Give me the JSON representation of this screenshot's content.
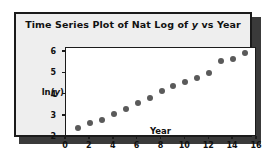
{
  "figure": {
    "title": "Time Series Plot of Nat Log of y vs Year",
    "title_parts": {
      "before_italic": "Time Series Plot of Nat Log of ",
      "italic": "y",
      "after_italic": " vs Year"
    },
    "background_color": "#eeeeee",
    "border_color": "#1b1b1b",
    "plot_background_color": "#ffffff",
    "marker_color": "#5a5a5a"
  },
  "axes": {
    "y_label_parts": {
      "before_italic": "ln(",
      "italic": "y",
      "after_italic": ")"
    },
    "y_label": "ln(y)",
    "x_label": "Year",
    "y_ticks": [
      "2",
      "3",
      "4",
      "5",
      "6"
    ],
    "x_ticks": [
      "0",
      "2",
      "4",
      "6",
      "8",
      "10",
      "12",
      "14",
      "16"
    ]
  },
  "chart_data": {
    "type": "scatter",
    "title": "Time Series Plot of Nat Log of y vs Year",
    "xlabel": "Year",
    "ylabel": "ln(y)",
    "xlim": [
      0,
      16
    ],
    "ylim": [
      2,
      6.2
    ],
    "xticks": [
      0,
      2,
      4,
      6,
      8,
      10,
      12,
      14,
      16
    ],
    "yticks": [
      2,
      3,
      4,
      5,
      6
    ],
    "grid": false,
    "legend": null,
    "marker": "filled-circle",
    "x": [
      1,
      2,
      3,
      4,
      5,
      6,
      7,
      8,
      9,
      10,
      11,
      12,
      13,
      14,
      15
    ],
    "y": [
      2.42,
      2.66,
      2.79,
      3.09,
      3.31,
      3.6,
      3.84,
      4.19,
      4.41,
      4.59,
      4.77,
      5.03,
      5.57,
      5.67,
      5.96
    ],
    "series": [
      {
        "name": "ln(y)",
        "points": [
          {
            "x": 1,
            "y": 2.42
          },
          {
            "x": 2,
            "y": 2.66
          },
          {
            "x": 3,
            "y": 2.79
          },
          {
            "x": 4,
            "y": 3.09
          },
          {
            "x": 5,
            "y": 3.31
          },
          {
            "x": 6,
            "y": 3.6
          },
          {
            "x": 7,
            "y": 3.84
          },
          {
            "x": 8,
            "y": 4.19
          },
          {
            "x": 9,
            "y": 4.41
          },
          {
            "x": 10,
            "y": 4.59
          },
          {
            "x": 11,
            "y": 4.77
          },
          {
            "x": 12,
            "y": 5.03
          },
          {
            "x": 13,
            "y": 5.57
          },
          {
            "x": 14,
            "y": 5.67
          },
          {
            "x": 15,
            "y": 5.96
          }
        ]
      }
    ]
  }
}
